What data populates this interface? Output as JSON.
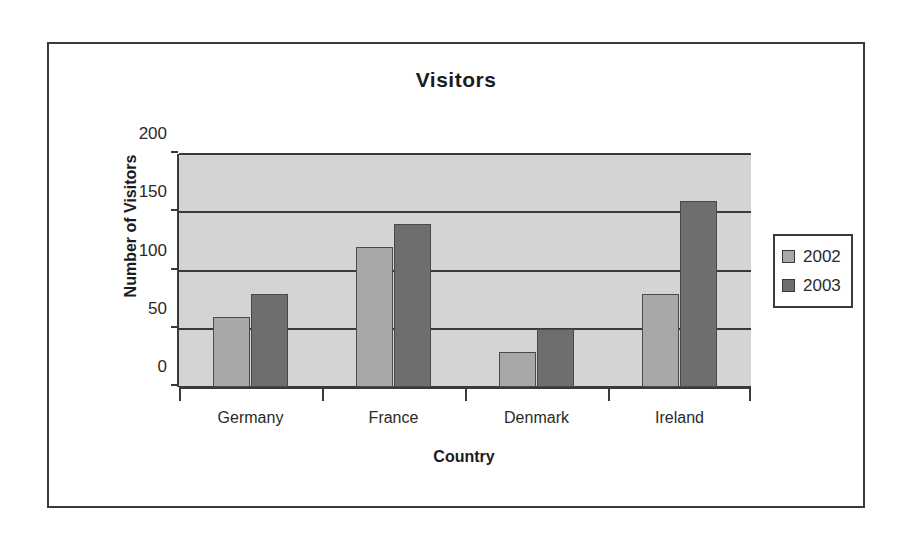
{
  "chart_data": {
    "type": "bar",
    "title": "Visitors",
    "xlabel": "Country",
    "ylabel": "Number of Visitors",
    "categories": [
      "Germany",
      "France",
      "Denmark",
      "Ireland"
    ],
    "series": [
      {
        "name": "2002",
        "color": "#a8a8a8",
        "values": [
          60,
          120,
          30,
          80
        ]
      },
      {
        "name": "2003",
        "color": "#6e6e6e",
        "values": [
          80,
          140,
          50,
          160
        ]
      }
    ],
    "ylim": [
      0,
      200
    ],
    "yticks": [
      0,
      50,
      100,
      150,
      200
    ],
    "ytick_labels": [
      "0",
      "50",
      "100",
      "150",
      "200"
    ],
    "grid": true,
    "grid_axis": "y",
    "legend_position": "right",
    "plot_background": "#d4d4d4",
    "frame_border_color": "#3a3a3a"
  }
}
